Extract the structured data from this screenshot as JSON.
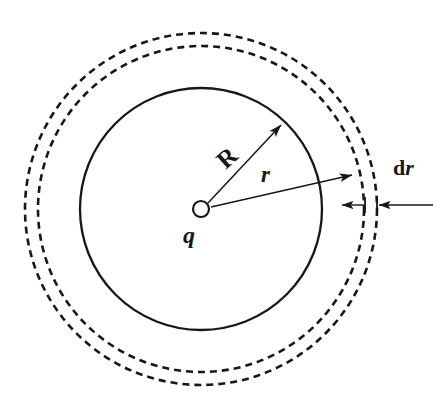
{
  "figure": {
    "type": "physics-diagram",
    "background_color": "#ffffff",
    "stroke_color": "#171717"
  },
  "labels": {
    "charge": "q",
    "inner_radius": "R",
    "shell_radius": "r",
    "thickness_d": "d",
    "thickness_r": "r",
    "thickness_full": "dr"
  },
  "geometry": {
    "center": {
      "x": 201,
      "y": 209
    },
    "solid_circle": {
      "radius": 121,
      "style": "solid",
      "stroke_width": 2.3
    },
    "dashed_inner_circle": {
      "radius": 163,
      "style": "dashed",
      "stroke_width": 2.6,
      "dash": "7 5"
    },
    "dashed_outer_circle": {
      "radius": 176,
      "style": "dashed",
      "stroke_width": 2.6,
      "dash": "7 5"
    },
    "charge_marker": {
      "radius": 8,
      "fill": "#ffffff",
      "stroke_width": 2.2
    },
    "arrow_R": {
      "from": {
        "x": 208,
        "y": 203
      },
      "to": {
        "x": 284,
        "y": 122
      }
    },
    "arrow_r": {
      "from": {
        "x": 211,
        "y": 207
      },
      "to": {
        "x": 356,
        "y": 174
      }
    },
    "dimension_line": {
      "y": 205,
      "x_start": 333,
      "x_end": 433
    },
    "dimension_tick_inner_x": 364,
    "dimension_tick_outer_x": 377
  },
  "colors": {
    "stroke": "#171717",
    "background": "#ffffff"
  }
}
